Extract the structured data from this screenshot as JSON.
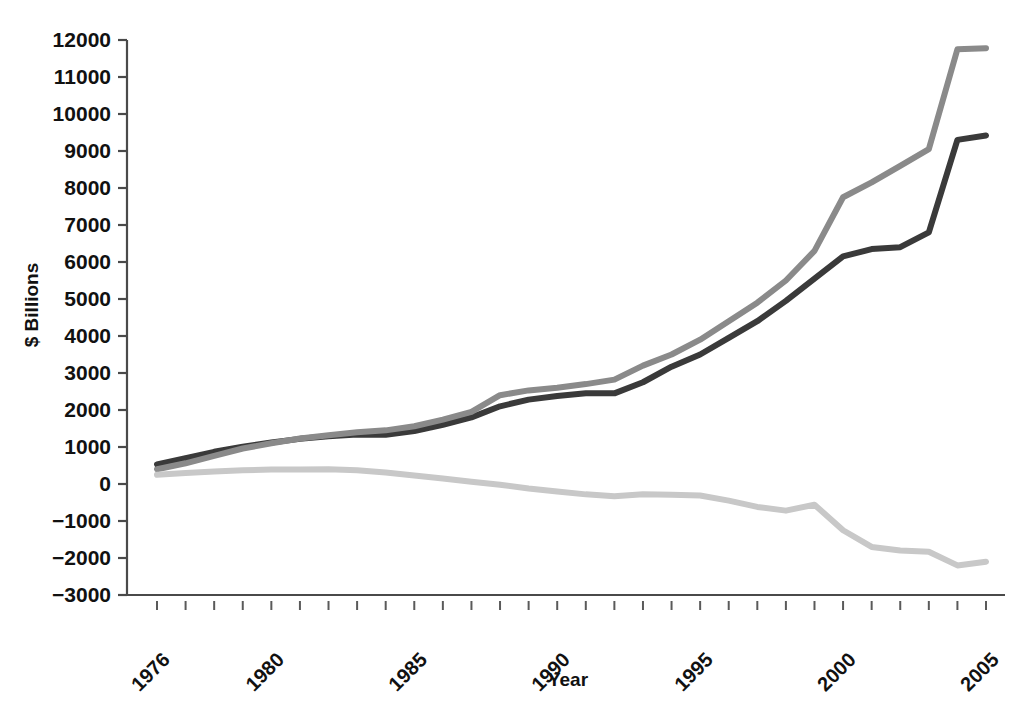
{
  "chart_data": {
    "type": "line",
    "title": "",
    "xlabel": "Year",
    "ylabel": "$ Billions",
    "xlim": [
      1975,
      2005
    ],
    "ylim": [
      -3000,
      12000
    ],
    "grid": false,
    "legend": "none",
    "y_ticks": [
      12000,
      11000,
      10000,
      9000,
      8000,
      7000,
      6000,
      5000,
      4000,
      3000,
      2000,
      1000,
      0,
      -1000,
      -2000,
      -3000
    ],
    "y_tick_labels": [
      "12000",
      "11000",
      "10000",
      "9000",
      "8000",
      "7000",
      "6000",
      "5000",
      "4000",
      "3000",
      "2000",
      "1000",
      "0",
      "−1000",
      "−2000",
      "−3000"
    ],
    "x_ticks": [
      1976,
      1977,
      1978,
      1979,
      1980,
      1981,
      1982,
      1983,
      1984,
      1985,
      1986,
      1987,
      1988,
      1989,
      1990,
      1991,
      1992,
      1993,
      1994,
      1995,
      1996,
      1997,
      1998,
      1999,
      2000,
      2001,
      2002,
      2003,
      2004,
      2005
    ],
    "x_tick_labels_shown": [
      "1976",
      "1980",
      "1985",
      "1990",
      "1995",
      "2000",
      "2005"
    ],
    "x_tick_label_rotation_deg": 45,
    "x": [
      1976,
      1977,
      1978,
      1979,
      1980,
      1981,
      1982,
      1983,
      1984,
      1985,
      1986,
      1987,
      1988,
      1989,
      1990,
      1991,
      1992,
      1993,
      1994,
      1995,
      1996,
      1997,
      1998,
      1999,
      2000,
      2001,
      2002,
      2003,
      2004,
      2005
    ],
    "series": [
      {
        "name": "series-dark",
        "color": "#3a3a3a",
        "width": 6,
        "values": [
          530,
          700,
          870,
          1010,
          1120,
          1220,
          1290,
          1340,
          1330,
          1430,
          1600,
          1800,
          2100,
          2280,
          2380,
          2450,
          2450,
          2750,
          3170,
          3500,
          3950,
          4400,
          4950,
          5550,
          6150,
          6350,
          6400,
          6800,
          9300,
          9420
        ]
      },
      {
        "name": "series-medium",
        "color": "#8a8a8a",
        "width": 6,
        "values": [
          400,
          560,
          760,
          960,
          1100,
          1230,
          1320,
          1400,
          1450,
          1560,
          1740,
          1950,
          2400,
          2530,
          2600,
          2700,
          2820,
          3200,
          3500,
          3900,
          4400,
          4900,
          5500,
          6300,
          7750,
          8150,
          8600,
          9050,
          11750,
          11780
        ]
      },
      {
        "name": "series-light",
        "color": "#c8c8c8",
        "width": 6,
        "values": [
          250,
          300,
          340,
          370,
          390,
          395,
          400,
          370,
          310,
          230,
          150,
          60,
          -20,
          -120,
          -200,
          -280,
          -330,
          -280,
          -290,
          -310,
          -450,
          -620,
          -720,
          -560,
          -1250,
          -1700,
          -1800,
          -1830,
          -2200,
          -2100
        ]
      }
    ]
  },
  "axes": {
    "y_axis_title": "$ Billions",
    "x_axis_title": "Year"
  }
}
